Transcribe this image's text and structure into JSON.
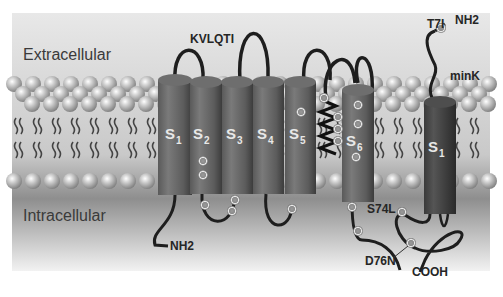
{
  "figure": {
    "regions": {
      "extracellular": "Extracellular",
      "intracellular": "Intracellular"
    },
    "proteins": {
      "kvlqt1": {
        "name": "KVLQTI",
        "segments": [
          {
            "base": "S",
            "sub": "1"
          },
          {
            "base": "S",
            "sub": "2"
          },
          {
            "base": "S",
            "sub": "3"
          },
          {
            "base": "S",
            "sub": "4"
          },
          {
            "base": "S",
            "sub": "5"
          },
          {
            "base": "S",
            "sub": "6"
          }
        ],
        "n_terminus": "NH2"
      },
      "mink": {
        "name": "minK",
        "segment": {
          "base": "S",
          "sub": "1"
        },
        "n_terminus": "NH2",
        "c_terminus": "COOH",
        "mutations": [
          "T7I",
          "S74L",
          "D76N"
        ]
      }
    },
    "colors": {
      "background_top": "#e6e6e6",
      "background_bottom": "#f4f4f4",
      "intracellular_dark": "#8a8a8a",
      "cylinder": "#6c6c6c",
      "cylinder_dark": "#444444",
      "mink_cylinder": "#4a4a4a",
      "lipid_head": "#b8b8b8",
      "chain": "#1e1e1e"
    }
  }
}
